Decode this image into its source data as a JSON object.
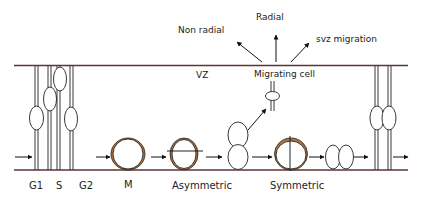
{
  "diagram": {
    "zone_label": "VZ",
    "migrating_cell_label": "Migrating cell",
    "migration_routes": [
      {
        "id": "non-radial",
        "label": "Non radial"
      },
      {
        "id": "radial",
        "label": "Radial"
      },
      {
        "id": "svz",
        "label": "svz migration"
      }
    ],
    "stages": [
      {
        "id": "g1",
        "label": "G1"
      },
      {
        "id": "s",
        "label": "S"
      },
      {
        "id": "g2",
        "label": "G2"
      },
      {
        "id": "m",
        "label": "M"
      },
      {
        "id": "asymmetric",
        "label": "Asymmetric"
      },
      {
        "id": "symmetric",
        "label": "Symmetric"
      }
    ],
    "colors": {
      "boundary_line": "#5b3434",
      "division_cap": "#b0703a",
      "stroke": "#222222"
    }
  }
}
